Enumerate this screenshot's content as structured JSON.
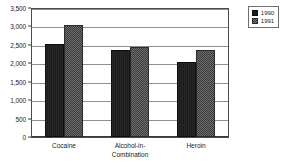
{
  "chart_data": {
    "type": "bar",
    "title": "",
    "xlabel": "",
    "ylabel": "",
    "ylim": [
      0,
      3500
    ],
    "ytick_step": 500,
    "grid": true,
    "legend_position": "top-right",
    "categories": [
      "Cocaine",
      "Alcohol-in-Combination",
      "Heroin"
    ],
    "category_labels": [
      "Cocaine",
      "Alcohol-in-\nCombination",
      "Heroin"
    ],
    "ytick_labels": [
      "3,500",
      "3,000",
      "2,500",
      "2,000",
      "1,500",
      "1,000",
      "500",
      "0"
    ],
    "ytick_values": [
      3500,
      3000,
      2500,
      2000,
      1500,
      1000,
      500,
      0
    ],
    "series": [
      {
        "name": "1990",
        "color": "#1c1c1c",
        "values": [
          2530,
          2360,
          2030
        ]
      },
      {
        "name": "1991",
        "color": "#4b4b4b",
        "values": [
          3050,
          2450,
          2370
        ]
      }
    ]
  },
  "legend": {
    "entries": [
      {
        "label": "1990",
        "swatch": "legend-swatch-1990"
      },
      {
        "label": "1991",
        "swatch": "legend-swatch-1991"
      }
    ]
  }
}
